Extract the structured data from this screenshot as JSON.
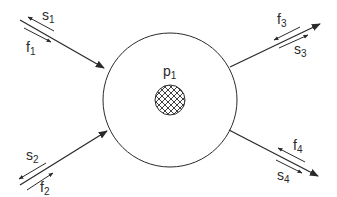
{
  "diagram": {
    "center_node": {
      "label": "p",
      "subscript": "1"
    },
    "flows": [
      {
        "id": "left-top",
        "s_label": "s",
        "s_sub": "1",
        "f_label": "f",
        "f_sub": "1",
        "direction": "in"
      },
      {
        "id": "left-bottom",
        "s_label": "s",
        "s_sub": "2",
        "f_label": "f",
        "f_sub": "2",
        "direction": "in"
      },
      {
        "id": "right-top",
        "f_label": "f",
        "f_sub": "3",
        "s_label": "s",
        "s_sub": "3",
        "direction": "out"
      },
      {
        "id": "right-bottom",
        "f_label": "f",
        "f_sub": "4",
        "s_label": "s",
        "s_sub": "4",
        "direction": "out"
      }
    ]
  },
  "colors": {
    "stroke": "#2a2a2a",
    "background": "#ffffff"
  }
}
